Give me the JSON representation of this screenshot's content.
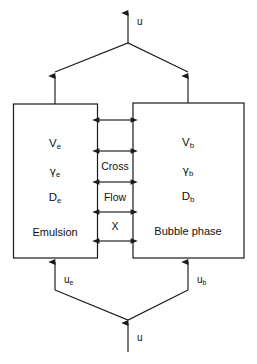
{
  "diagram": {
    "line_color": "#1a1a1a",
    "background_color": "#ffffff",
    "top_outlet": {
      "label": "u",
      "icon": "arrow-up-icon"
    },
    "bottom_inlet": {
      "label": "u",
      "icon": "arrow-up-icon"
    },
    "left_box": {
      "name": "Emulsion",
      "volume": "V",
      "volume_sub": "e",
      "gamma": "γ",
      "gamma_sub": "e",
      "dispersion": "D",
      "dispersion_sub": "e",
      "phase_label": "Emulsion",
      "inlet_label": "u",
      "inlet_sub": "e"
    },
    "right_box": {
      "name": "Bubble phase",
      "volume": "V",
      "volume_sub": "b",
      "gamma": "γ",
      "gamma_sub": "b",
      "dispersion": "D",
      "dispersion_sub": "b",
      "phase_label": "Bubble phase",
      "inlet_label": "u",
      "inlet_sub": "b"
    },
    "cross_flow": {
      "line1": "Cross",
      "line2": "Flow",
      "line3": "X",
      "arrow_count": 4,
      "arrow_icon": "double-headed-arrow-icon"
    }
  }
}
